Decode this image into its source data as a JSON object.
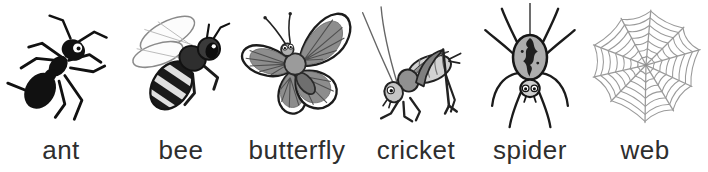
{
  "strip": {
    "description_labels": [
      "ant",
      "bee",
      "butterfly",
      "cricket",
      "spider",
      "web"
    ]
  },
  "cards": [
    {
      "label": "ant",
      "icon": "ant-icon"
    },
    {
      "label": "bee",
      "icon": "bee-icon"
    },
    {
      "label": "butterfly",
      "icon": "butterfly-icon"
    },
    {
      "label": "cricket",
      "icon": "cricket-icon"
    },
    {
      "label": "spider",
      "icon": "spider-icon"
    },
    {
      "label": "web",
      "icon": "web-icon"
    }
  ],
  "colors": {
    "background": "#ffffff",
    "ink": "#1a1a1a",
    "label_text": "#2e2e2e",
    "mid_gray": "#8d8d8d",
    "light_gray": "#d8d8d8",
    "web_line": "#9a9a9a"
  }
}
